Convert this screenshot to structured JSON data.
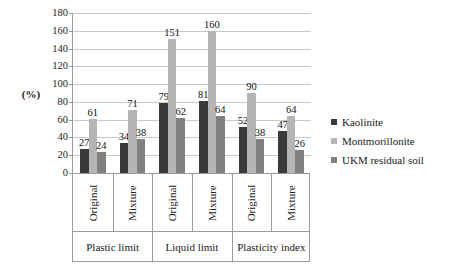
{
  "chart_data": {
    "type": "bar",
    "title": "",
    "xlabel": "",
    "ylabel": "(%)",
    "ylim": [
      0,
      180
    ],
    "ytick_step": 20,
    "yticks": [
      180,
      160,
      140,
      120,
      100,
      80,
      60,
      40,
      20,
      0
    ],
    "grid": true,
    "legend_position": "right",
    "orientation": "vertical",
    "grouping": "clustered",
    "categories": [
      "Original",
      "Mixture",
      "Original",
      "Mixture",
      "Original",
      "Mixture"
    ],
    "group_labels": [
      "Plastic limit",
      "Liquid limit",
      "Plasticity index"
    ],
    "series": [
      {
        "name": "Kaolinite",
        "color": "#3a3a3a",
        "values": [
          27,
          34,
          79,
          81,
          52,
          47
        ]
      },
      {
        "name": "Montmorillonite",
        "color": "#b5b5b5",
        "values": [
          61,
          71,
          151,
          160,
          90,
          64
        ]
      },
      {
        "name": "UKM residual soil",
        "color": "#808080",
        "values": [
          24,
          38,
          62,
          64,
          38,
          26
        ]
      }
    ],
    "data_labels": [
      {
        "group": "Plastic limit",
        "category": "Original",
        "Kaolinite": 27,
        "Montmorillonite": 61,
        "UKM residual soil": 24
      },
      {
        "group": "Plastic limit",
        "category": "Mixture",
        "Kaolinite": 34,
        "Montmorillonite": 71,
        "UKM residual soil": 38
      },
      {
        "group": "Liquid limit",
        "category": "Original",
        "Kaolinite": 79,
        "Montmorillonite": 151,
        "UKM residual soil": 62
      },
      {
        "group": "Liquid limit",
        "category": "Mixture",
        "Kaolinite": 81,
        "Montmorillonite": 160,
        "UKM residual soil": 64
      },
      {
        "group": "Plasticity index",
        "category": "Original",
        "Kaolinite": 52,
        "Montmorillonite": 90,
        "UKM residual soil": 38
      },
      {
        "group": "Plasticity index",
        "category": "Mixture",
        "Kaolinite": 47,
        "Montmorillonite": 64,
        "UKM residual soil": 26
      }
    ]
  },
  "axis": {
    "y_title": "(%)"
  },
  "legend": {
    "items": [
      {
        "label": "Kaolinite",
        "color": "#3a3a3a"
      },
      {
        "label": "Montmorillonite",
        "color": "#b5b5b5"
      },
      {
        "label": "UKM residual soil",
        "color": "#808080"
      }
    ]
  },
  "colors": {
    "gridline": "#c8c8c8",
    "axis": "#9a9a9a",
    "text": "#1a1a1a",
    "background": "#ffffff"
  }
}
